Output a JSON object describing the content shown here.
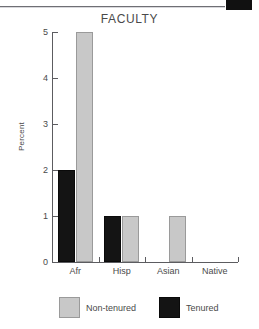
{
  "chart_data": {
    "type": "bar",
    "title": "FACULTY",
    "xlabel": "",
    "ylabel": "Percent",
    "categories": [
      "Afr",
      "Hisp",
      "Asian",
      "Native"
    ],
    "series": [
      {
        "name": "Non-tenured",
        "color": "#c8c8c8",
        "values": [
          5,
          1,
          1,
          0
        ]
      },
      {
        "name": "Tenured",
        "color": "#141414",
        "values": [
          2,
          1,
          0,
          0
        ]
      }
    ],
    "ylim": [
      0,
      5
    ],
    "yticks": [
      0,
      1,
      2,
      3,
      4,
      5
    ],
    "ytick_labels": [
      "0",
      "1",
      "2",
      "3",
      "4",
      "5"
    ],
    "grid": false,
    "legend_position": "bottom"
  },
  "legend": {
    "items": [
      {
        "label": "Non-tenured"
      },
      {
        "label": "Tenured"
      }
    ]
  },
  "decorations": {
    "corner_block_color": "#111111",
    "rule_color": "#6f6f74"
  }
}
